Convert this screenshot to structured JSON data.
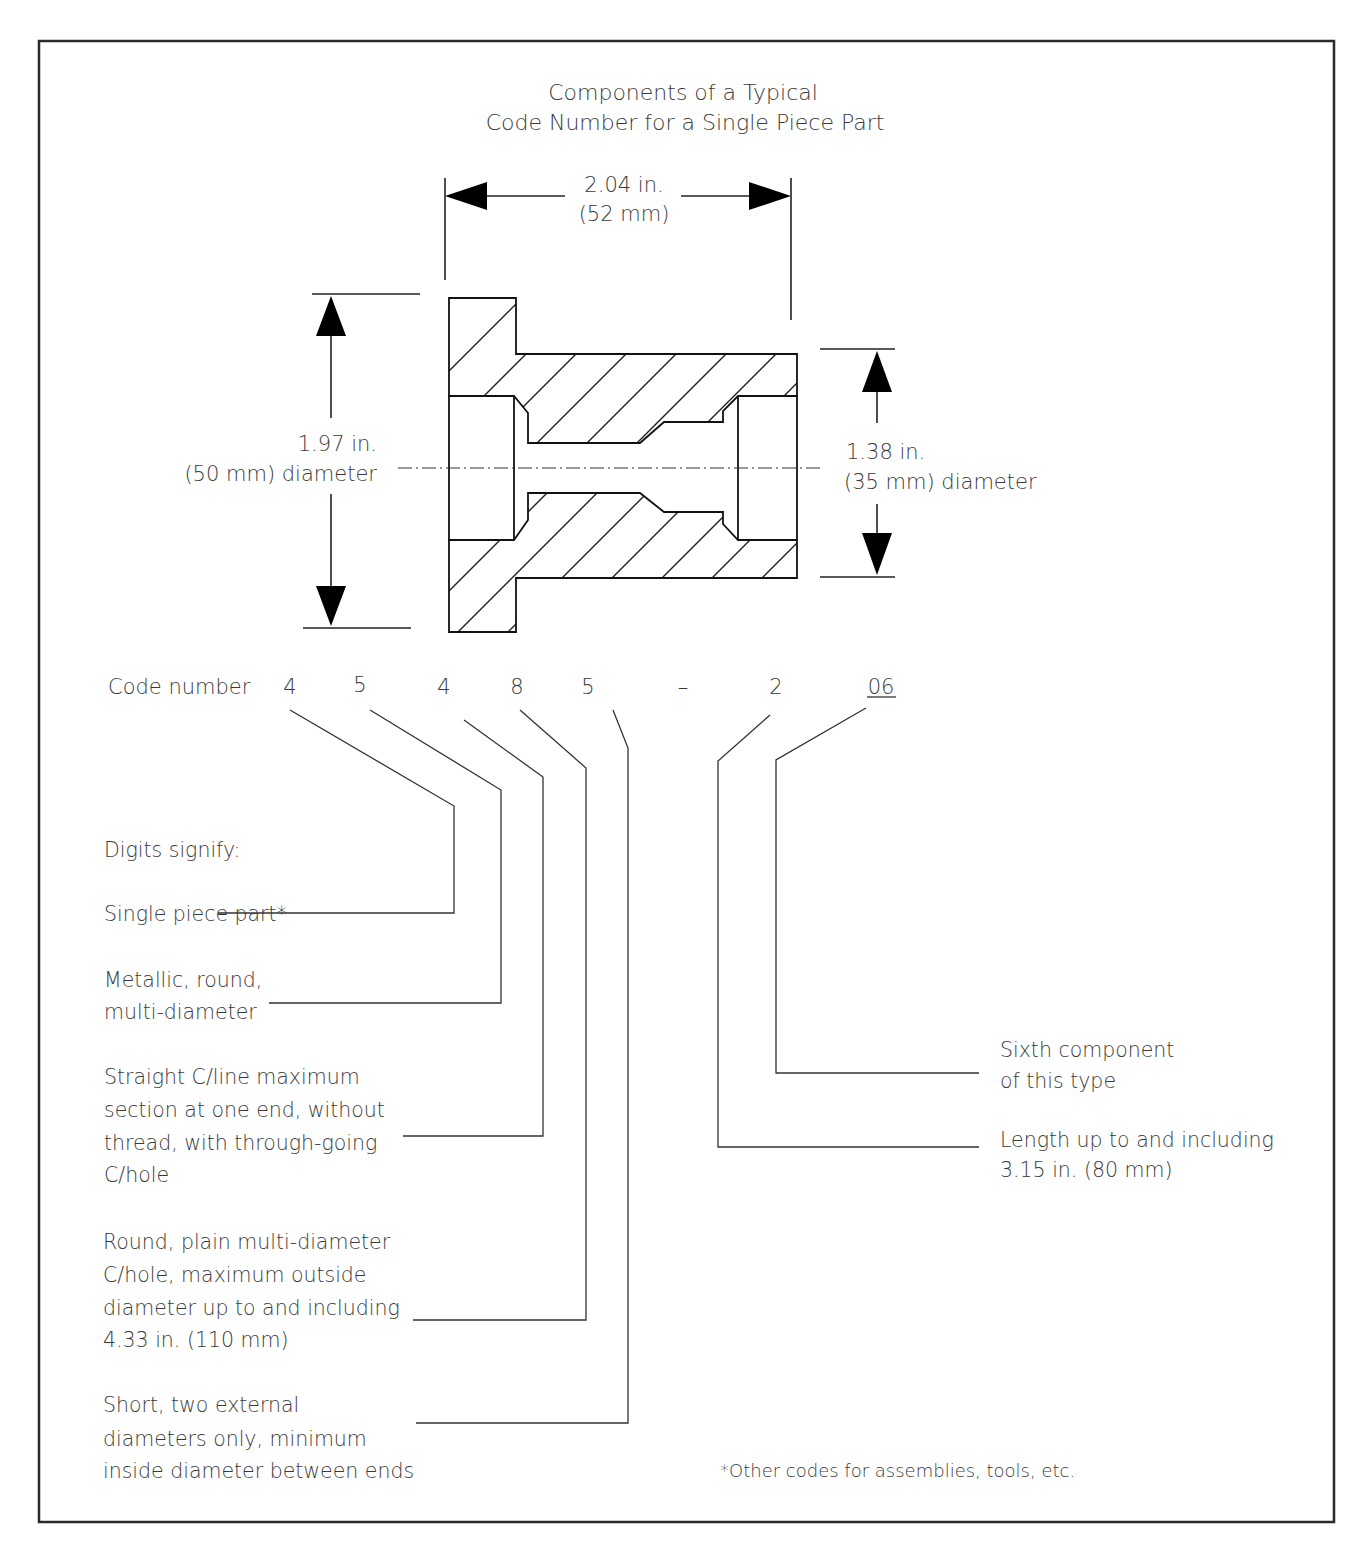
{
  "figure": {
    "title_line1": "Components of a Typical",
    "title_line2": "Code Number for a Single Piece Part"
  },
  "dimensions": {
    "length": {
      "line1": "2.04 in.",
      "line2": "(52 mm)"
    },
    "large_diameter": {
      "line1": "1.97 in.",
      "line2": "(50 mm) diameter"
    },
    "small_diameter": {
      "line1": "1.38 in.",
      "line2": "(35 mm) diameter"
    }
  },
  "code_number": {
    "label": "Code number",
    "digits": [
      "4",
      "5",
      "4",
      "8",
      "5",
      "–",
      "2",
      "06"
    ]
  },
  "legend": {
    "heading": "Digits signify:",
    "items": [
      {
        "lines": [
          "Single piece part*"
        ]
      },
      {
        "lines": [
          "Metallic, round,",
          "multi-diameter"
        ]
      },
      {
        "lines": [
          "Straight C/line maximum",
          "section at one end, without",
          "thread, with through-going",
          "C/hole"
        ]
      },
      {
        "lines": [
          "Round, plain multi-diameter",
          "C/hole, maximum outside",
          "diameter up to and including",
          "4.33 in. (110 mm)"
        ]
      },
      {
        "lines": [
          "Short, two external",
          "diameters only, minimum",
          "inside diameter between ends"
        ]
      }
    ],
    "right_items": [
      {
        "lines": [
          "Sixth component",
          "of this type"
        ]
      },
      {
        "lines": [
          "Length up to and including",
          "3.15 in. (80 mm)"
        ]
      }
    ]
  },
  "footnote": "*Other codes for assemblies, tools, etc."
}
